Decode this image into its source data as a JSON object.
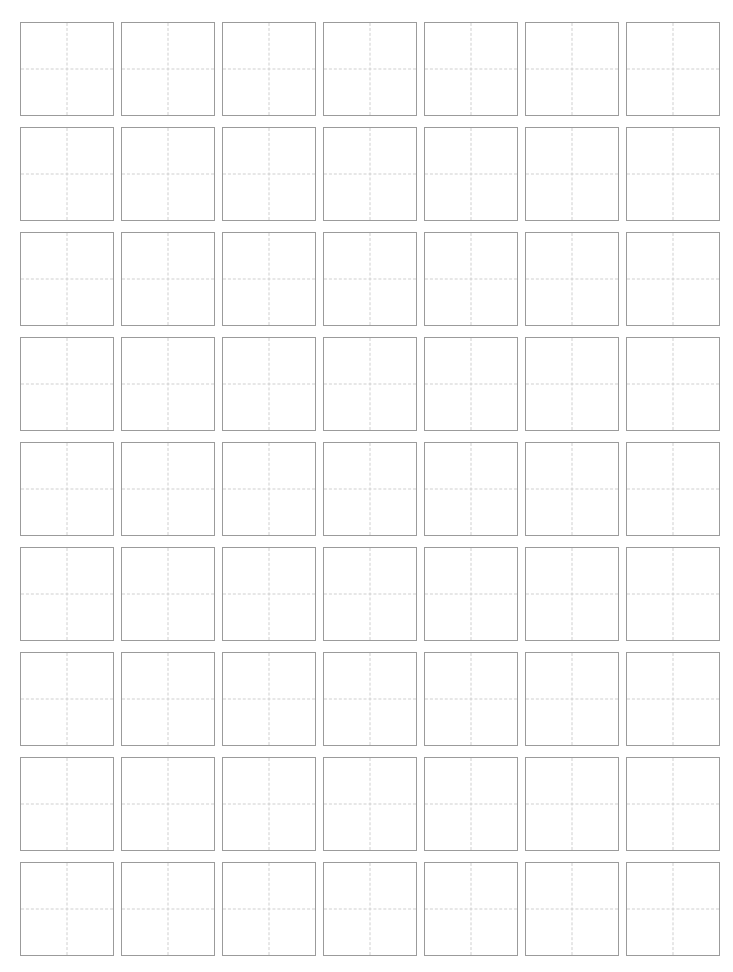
{
  "page": {
    "background_color": "#ffffff",
    "width": 733,
    "height": 972
  },
  "grid": {
    "name": "character-practice-grid",
    "columns": 7,
    "rows": 9,
    "total_cells": 63,
    "cell_width": 94,
    "cell_height": 94,
    "column_gap": 7,
    "row_gap": 11,
    "margin_left": 20,
    "margin_top": 22,
    "cell_border_color": "#9b9b9b",
    "cell_fill_color": "#ffffff",
    "guide_color": "#cfcfcf",
    "guide_style": "dashed",
    "guides_per_cell": [
      "vertical-center",
      "horizontal-center"
    ],
    "cells": [
      {
        "row": 1,
        "col": 1,
        "text": ""
      },
      {
        "row": 1,
        "col": 2,
        "text": ""
      },
      {
        "row": 1,
        "col": 3,
        "text": ""
      },
      {
        "row": 1,
        "col": 4,
        "text": ""
      },
      {
        "row": 1,
        "col": 5,
        "text": ""
      },
      {
        "row": 1,
        "col": 6,
        "text": ""
      },
      {
        "row": 1,
        "col": 7,
        "text": ""
      },
      {
        "row": 2,
        "col": 1,
        "text": ""
      },
      {
        "row": 2,
        "col": 2,
        "text": ""
      },
      {
        "row": 2,
        "col": 3,
        "text": ""
      },
      {
        "row": 2,
        "col": 4,
        "text": ""
      },
      {
        "row": 2,
        "col": 5,
        "text": ""
      },
      {
        "row": 2,
        "col": 6,
        "text": ""
      },
      {
        "row": 2,
        "col": 7,
        "text": ""
      },
      {
        "row": 3,
        "col": 1,
        "text": ""
      },
      {
        "row": 3,
        "col": 2,
        "text": ""
      },
      {
        "row": 3,
        "col": 3,
        "text": ""
      },
      {
        "row": 3,
        "col": 4,
        "text": ""
      },
      {
        "row": 3,
        "col": 5,
        "text": ""
      },
      {
        "row": 3,
        "col": 6,
        "text": ""
      },
      {
        "row": 3,
        "col": 7,
        "text": ""
      },
      {
        "row": 4,
        "col": 1,
        "text": ""
      },
      {
        "row": 4,
        "col": 2,
        "text": ""
      },
      {
        "row": 4,
        "col": 3,
        "text": ""
      },
      {
        "row": 4,
        "col": 4,
        "text": ""
      },
      {
        "row": 4,
        "col": 5,
        "text": ""
      },
      {
        "row": 4,
        "col": 6,
        "text": ""
      },
      {
        "row": 4,
        "col": 7,
        "text": ""
      },
      {
        "row": 5,
        "col": 1,
        "text": ""
      },
      {
        "row": 5,
        "col": 2,
        "text": ""
      },
      {
        "row": 5,
        "col": 3,
        "text": ""
      },
      {
        "row": 5,
        "col": 4,
        "text": ""
      },
      {
        "row": 5,
        "col": 5,
        "text": ""
      },
      {
        "row": 5,
        "col": 6,
        "text": ""
      },
      {
        "row": 5,
        "col": 7,
        "text": ""
      },
      {
        "row": 6,
        "col": 1,
        "text": ""
      },
      {
        "row": 6,
        "col": 2,
        "text": ""
      },
      {
        "row": 6,
        "col": 3,
        "text": ""
      },
      {
        "row": 6,
        "col": 4,
        "text": ""
      },
      {
        "row": 6,
        "col": 5,
        "text": ""
      },
      {
        "row": 6,
        "col": 6,
        "text": ""
      },
      {
        "row": 6,
        "col": 7,
        "text": ""
      },
      {
        "row": 7,
        "col": 1,
        "text": ""
      },
      {
        "row": 7,
        "col": 2,
        "text": ""
      },
      {
        "row": 7,
        "col": 3,
        "text": ""
      },
      {
        "row": 7,
        "col": 4,
        "text": ""
      },
      {
        "row": 7,
        "col": 5,
        "text": ""
      },
      {
        "row": 7,
        "col": 6,
        "text": ""
      },
      {
        "row": 7,
        "col": 7,
        "text": ""
      },
      {
        "row": 8,
        "col": 1,
        "text": ""
      },
      {
        "row": 8,
        "col": 2,
        "text": ""
      },
      {
        "row": 8,
        "col": 3,
        "text": ""
      },
      {
        "row": 8,
        "col": 4,
        "text": ""
      },
      {
        "row": 8,
        "col": 5,
        "text": ""
      },
      {
        "row": 8,
        "col": 6,
        "text": ""
      },
      {
        "row": 8,
        "col": 7,
        "text": ""
      },
      {
        "row": 9,
        "col": 1,
        "text": ""
      },
      {
        "row": 9,
        "col": 2,
        "text": ""
      },
      {
        "row": 9,
        "col": 3,
        "text": ""
      },
      {
        "row": 9,
        "col": 4,
        "text": ""
      },
      {
        "row": 9,
        "col": 5,
        "text": ""
      },
      {
        "row": 9,
        "col": 6,
        "text": ""
      },
      {
        "row": 9,
        "col": 7,
        "text": ""
      }
    ]
  }
}
